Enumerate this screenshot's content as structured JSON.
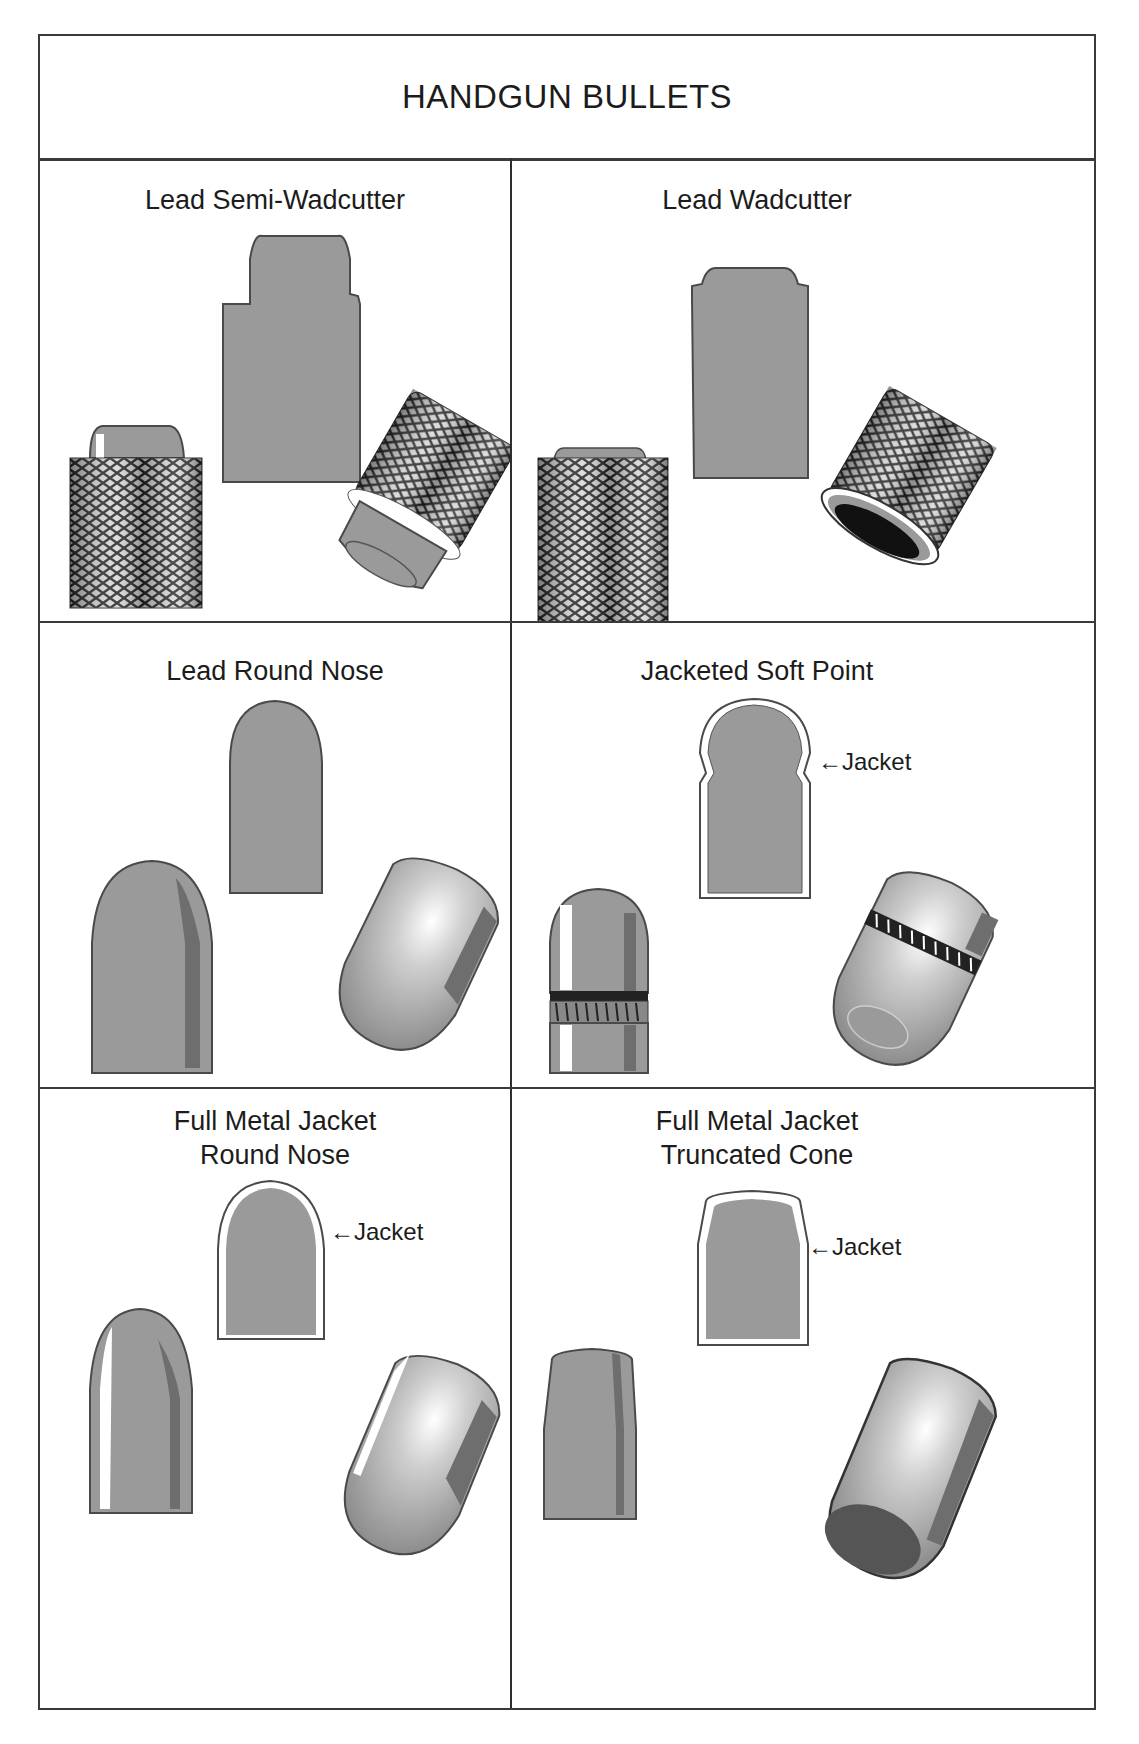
{
  "title": "HANDGUN BULLETS",
  "panels": [
    {
      "id": "lead-semi-wadcutter",
      "label": "Lead Semi-Wadcutter",
      "callout": null
    },
    {
      "id": "lead-wadcutter",
      "label": "Lead Wadcutter",
      "callout": null
    },
    {
      "id": "lead-round-nose",
      "label": "Lead Round Nose",
      "callout": null
    },
    {
      "id": "jacketed-soft-point",
      "label": "Jacketed Soft Point",
      "callout": "Jacket"
    },
    {
      "id": "fmj-round-nose",
      "label_line1": "Full Metal Jacket",
      "label_line2": "Round Nose",
      "callout": "Jacket"
    },
    {
      "id": "fmj-truncated-cone",
      "label_line1": "Full Metal Jacket",
      "label_line2": "Truncated Cone",
      "callout": "Jacket"
    }
  ],
  "colors": {
    "lead": "#9a9a9a",
    "lead_dark": "#6e6e6e",
    "outline": "#4a4a4a",
    "border": "#3a3a3a"
  }
}
